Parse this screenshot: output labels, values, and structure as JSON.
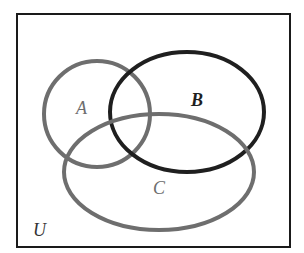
{
  "diagram": {
    "type": "venn",
    "universe": {
      "label": "U",
      "color": "#1a1a1a",
      "x": 17,
      "y": 14,
      "width": 273,
      "height": 233
    },
    "sets": [
      {
        "name": "A",
        "label": "A",
        "color": "#6e6e6e",
        "cx": 97,
        "cy": 114,
        "rx": 53,
        "ry": 53,
        "label_x": 76,
        "label_y": 114,
        "label_weight": "normal"
      },
      {
        "name": "B",
        "label": "B",
        "color": "#1f1f1f",
        "cx": 187,
        "cy": 112,
        "rx": 77,
        "ry": 60,
        "label_x": 191,
        "label_y": 106,
        "label_weight": "bold"
      },
      {
        "name": "C",
        "label": "C",
        "color": "#6e6e6e",
        "cx": 159,
        "cy": 172,
        "rx": 95,
        "ry": 58,
        "label_x": 153,
        "label_y": 194,
        "label_weight": "normal"
      }
    ],
    "universe_label_pos": {
      "x": 33,
      "y": 236
    }
  }
}
